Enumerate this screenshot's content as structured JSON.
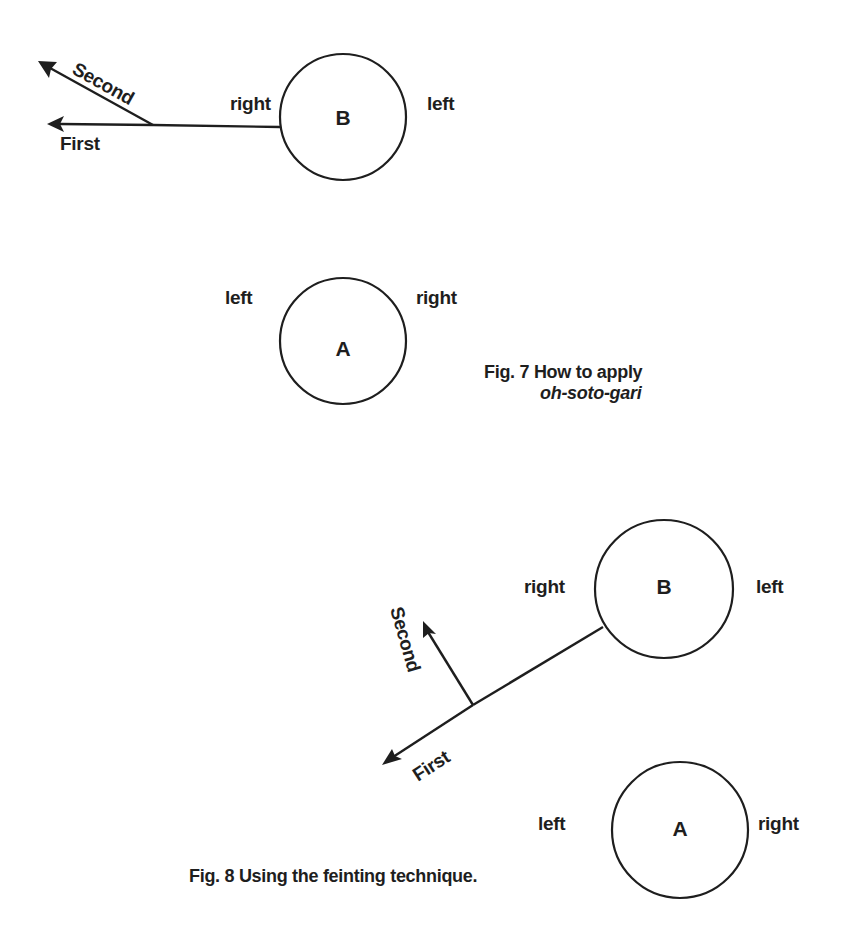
{
  "figures": [
    {
      "id": "fig7",
      "caption_line1": "Fig. 7 How to apply",
      "caption_line2": "oh-soto-gari",
      "person_b": {
        "label": "B",
        "side_left_of_circle": "right",
        "side_right_of_circle": "left"
      },
      "person_a": {
        "label": "A",
        "side_left_of_circle": "left",
        "side_right_of_circle": "right"
      },
      "arrows": {
        "first": "First",
        "second": "Second"
      }
    },
    {
      "id": "fig8",
      "caption": "Fig. 8 Using the feinting technique.",
      "person_b": {
        "label": "B",
        "side_left_of_circle": "right",
        "side_right_of_circle": "left"
      },
      "person_a": {
        "label": "A",
        "side_left_of_circle": "left",
        "side_right_of_circle": "right"
      },
      "arrows": {
        "first": "First",
        "second": "Second"
      }
    }
  ],
  "colors": {
    "ink": "#1e1e1e",
    "background": "#ffffff"
  }
}
